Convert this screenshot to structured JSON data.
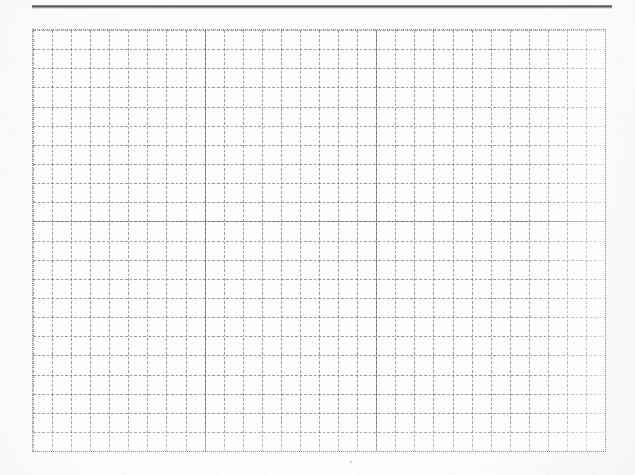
{
  "document": {
    "type": "scanned-grid-paper",
    "title": "",
    "body_text": "",
    "page_background_color": "#fdfdfd"
  },
  "rule": {
    "name": "top-horizontal-rule",
    "color": "#48484e",
    "left": 32,
    "top": 5,
    "width": 580,
    "thickness": 3
  },
  "grid": {
    "label": "",
    "line_color": "#5f5f69",
    "line_style": "dotted",
    "cell_width": 19.07,
    "cell_height": 19.14,
    "columns": 30,
    "rows": 22,
    "left": 33,
    "top": 30,
    "width": 572,
    "height": 421,
    "accent_columns": [
      9,
      18
    ],
    "accent_rows": [
      10
    ],
    "cell_background_color": "#fefefe"
  },
  "marks": {
    "stray_speck": {
      "name": "stray-speck",
      "x": 350,
      "y": 461
    }
  }
}
